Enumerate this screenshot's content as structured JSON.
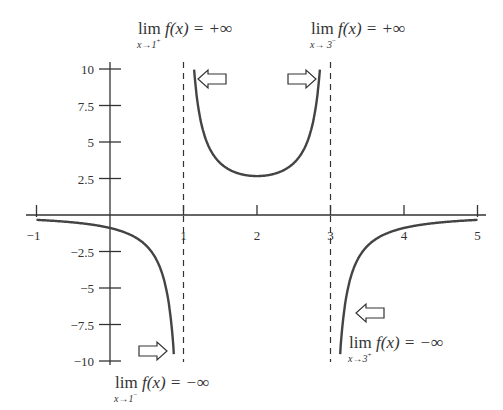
{
  "chart_data": {
    "type": "line",
    "title": "",
    "function": "f(x) = 8 / (3(x-1)(3-x))",
    "xlabel": "",
    "ylabel": "",
    "xlim": [
      -1,
      5
    ],
    "ylim": [
      -10,
      10
    ],
    "x_ticks": [
      "-1",
      "1",
      "2",
      "3",
      "4",
      "5"
    ],
    "y_ticks": [
      "10",
      "7.5",
      "5",
      "2.5",
      "-2.5",
      "-5",
      "-7.5",
      "-10"
    ],
    "grid": false,
    "vertical_asymptotes": [
      1,
      3
    ],
    "series": [
      {
        "name": "branch-left",
        "x": [
          -1,
          -0.5,
          0,
          0.5,
          0.8,
          0.9
        ],
        "values": [
          -0.33,
          -0.51,
          -0.89,
          -2.13,
          -6.06,
          -12.7
        ]
      },
      {
        "name": "branch-middle",
        "x": [
          1.1,
          1.25,
          1.5,
          2,
          2.5,
          2.75,
          2.9
        ],
        "values": [
          13.9,
          6.1,
          3.56,
          2.67,
          3.56,
          6.1,
          13.9
        ]
      },
      {
        "name": "branch-right",
        "x": [
          3.1,
          3.25,
          3.5,
          4,
          4.5,
          5
        ],
        "values": [
          -12.7,
          -4.9,
          -2.13,
          -0.89,
          -0.51,
          -0.33
        ]
      }
    ],
    "annotations": [
      {
        "id": "lim1plus",
        "lim": "lim",
        "sub": "x→1",
        "sup": "+",
        "expr": "f(x) = +∞"
      },
      {
        "id": "lim3minus",
        "lim": "lim",
        "sub": "x→ 3",
        "sup": "−",
        "expr": "f(x) = +∞"
      },
      {
        "id": "lim1minus",
        "lim": "lim",
        "sub": "x→1",
        "sup": "−",
        "expr": "f(x) = −∞"
      },
      {
        "id": "lim3plus",
        "lim": "lim",
        "sub": "x→3",
        "sup": "+",
        "expr": "f(x) = −∞"
      }
    ]
  }
}
